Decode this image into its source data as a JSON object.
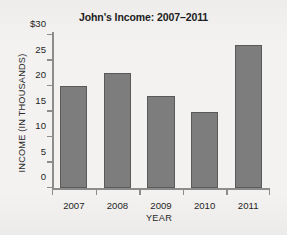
{
  "chart_data": {
    "type": "bar",
    "title": "John's Income: 2007–2011",
    "xlabel": "YEAR",
    "ylabel": "INCOME  (IN THOUSANDS)",
    "categories": [
      "2007",
      "2008",
      "2009",
      "2010",
      "2011"
    ],
    "values": [
      20,
      22.5,
      18,
      15,
      28
    ],
    "ylim": [
      0,
      30
    ],
    "ytick_values": [
      0,
      5,
      10,
      15,
      20,
      25,
      30
    ],
    "ytick_labels": [
      "0",
      "5",
      "10",
      "15",
      "20",
      "25",
      "$30"
    ],
    "grid": false,
    "legend": null,
    "bar_color": "#7d7d7d",
    "bar_edge_color": "#5a5a5a",
    "axis_color": "#8c8c8c",
    "background_color": "#f3f2f0",
    "text_color": "#1f1f1f"
  }
}
